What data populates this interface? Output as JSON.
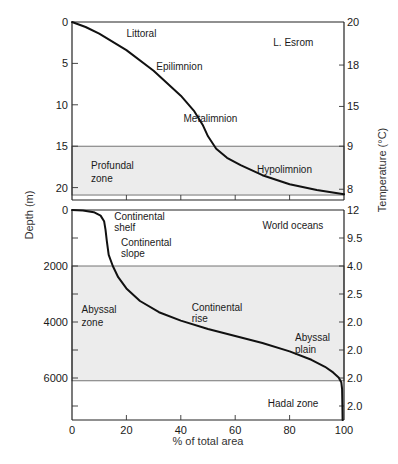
{
  "chart_data": [
    {
      "type": "line",
      "title": "L. Esrom",
      "xlabel": "% of total area",
      "ylabel": "Depth (m)",
      "y2label": "Temperature (°C)",
      "xlim": [
        0,
        100
      ],
      "ylim": [
        0,
        21.5
      ],
      "x_ticks": [
        0,
        20,
        40,
        60,
        80,
        100
      ],
      "y_ticks": [
        0,
        5,
        10,
        15,
        20
      ],
      "y_tick_labels": [
        "0",
        "5",
        "10",
        "15",
        "20"
      ],
      "y2_ticks": [
        {
          "depth": 0,
          "label": "20"
        },
        {
          "depth": 5.2,
          "label": "18"
        },
        {
          "depth": 10.2,
          "label": "15"
        },
        {
          "depth": 15,
          "label": "9"
        },
        {
          "depth": 20.2,
          "label": "8"
        }
      ],
      "shaded_band": {
        "from": 15,
        "to": 20.9
      },
      "series": [
        {
          "name": "hypsographic curve",
          "x": [
            0,
            5,
            10,
            20,
            30,
            40,
            45,
            48,
            50,
            53,
            57,
            62,
            70,
            80,
            90,
            100
          ],
          "y": [
            0,
            0.6,
            1.4,
            3.4,
            5.9,
            8.9,
            10.8,
            12.4,
            13.8,
            15.3,
            16.4,
            17.3,
            18.5,
            19.6,
            20.3,
            20.8
          ]
        }
      ],
      "annotations": [
        {
          "text": "Littoral",
          "x": 20,
          "y": 1.3
        },
        {
          "text": "Epilimnion",
          "x": 31,
          "y": 5.3
        },
        {
          "text": "Metalimnion",
          "x": 41,
          "y": 11.6
        },
        {
          "text": "Profundal",
          "x": 7,
          "y": 17.3
        },
        {
          "text": "zone",
          "x": 7,
          "y": 18.8
        },
        {
          "text": "Hypolimnion",
          "x": 68,
          "y": 17.8
        },
        {
          "text": "L. Esrom",
          "x": 74,
          "y": 2.4
        }
      ]
    },
    {
      "type": "line",
      "title": "World oceans",
      "xlabel": "% of total area",
      "ylabel": "Depth (m)",
      "y2label": "Temperature (°C)",
      "xlim": [
        0,
        100
      ],
      "ylim": [
        0,
        7500
      ],
      "x_ticks": [
        0,
        20,
        40,
        60,
        80,
        100
      ],
      "x_tick_labels": [
        "0",
        "20",
        "40",
        "60",
        "80",
        "100"
      ],
      "y_ticks": [
        0,
        1000,
        2000,
        3000,
        4000,
        5000,
        6000,
        7000
      ],
      "y_tick_labels": [
        "0",
        "",
        "2000",
        "",
        "4000",
        "",
        "6000",
        ""
      ],
      "y2_ticks": [
        {
          "depth": 0,
          "label": "12"
        },
        {
          "depth": 1000,
          "label": "9.5"
        },
        {
          "depth": 2000,
          "label": "4.0"
        },
        {
          "depth": 3000,
          "label": "2.5"
        },
        {
          "depth": 4000,
          "label": "2.0"
        },
        {
          "depth": 5000,
          "label": "2.0"
        },
        {
          "depth": 6000,
          "label": "2.0"
        },
        {
          "depth": 7000,
          "label": "2.0"
        }
      ],
      "shaded_band": {
        "from": 2000,
        "to": 6100
      },
      "series": [
        {
          "name": "hypsographic curve",
          "x": [
            0,
            4,
            8,
            10.5,
            11.8,
            12.3,
            12.8,
            13.5,
            15,
            17,
            20,
            25,
            32,
            40,
            50,
            60,
            70,
            80,
            88,
            93,
            96,
            98,
            99,
            99.3,
            99.4,
            99.5
          ],
          "y": [
            0,
            20,
            80,
            200,
            400,
            700,
            1100,
            1600,
            2000,
            2400,
            2800,
            3250,
            3650,
            3950,
            4250,
            4500,
            4750,
            5050,
            5350,
            5600,
            5800,
            5980,
            6150,
            6400,
            7000,
            7500
          ]
        }
      ],
      "annotations": [
        {
          "text": "Continental",
          "x": 15.5,
          "y": 220
        },
        {
          "text": "shelf",
          "x": 15.5,
          "y": 620
        },
        {
          "text": "Continental",
          "x": 18,
          "y": 1150
        },
        {
          "text": "slope",
          "x": 18,
          "y": 1550
        },
        {
          "text": "Abyssal",
          "x": 3.5,
          "y": 3550
        },
        {
          "text": "zone",
          "x": 3.5,
          "y": 4000
        },
        {
          "text": "Continental",
          "x": 44,
          "y": 3450
        },
        {
          "text": "rise",
          "x": 44,
          "y": 3850
        },
        {
          "text": "Abyssal",
          "x": 82,
          "y": 4550
        },
        {
          "text": "plain",
          "x": 82,
          "y": 4950
        },
        {
          "text": "World oceans",
          "x": 70,
          "y": 550
        },
        {
          "text": "Hadal zone",
          "x": 72,
          "y": 6900
        }
      ]
    }
  ],
  "labels": {
    "y_axis": "Depth (m)",
    "y2_axis": "Temperature (°C)",
    "x_axis": "% of total area"
  }
}
